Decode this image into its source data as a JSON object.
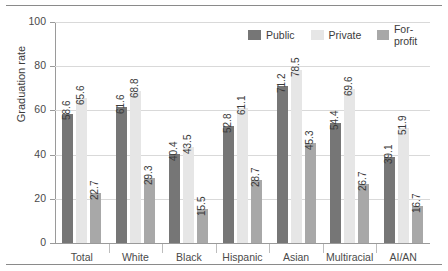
{
  "chart_data": {
    "type": "bar",
    "title": "",
    "subtitle": "",
    "xlabel": "",
    "ylabel": "Graduation rate",
    "ylim": [
      0,
      100
    ],
    "ytick_labels": [
      "0",
      "20",
      "40",
      "60",
      "80",
      "100"
    ],
    "ytick_values": [
      0,
      20,
      40,
      60,
      80,
      100
    ],
    "grid": true,
    "legend_position": "top-right",
    "categories": [
      "Total",
      "White",
      "Black",
      "Hispanic",
      "Asian",
      "Multiracial",
      "AI/AN"
    ],
    "series": [
      {
        "name": "Public",
        "color": "#767676",
        "values": [
          58.6,
          61.6,
          40.4,
          52.8,
          71.2,
          54.4,
          39.1
        ],
        "labels": [
          "58.6",
          "61.6",
          "40.4",
          "52.8",
          "71.2",
          "54.4",
          "39.1"
        ]
      },
      {
        "name": "Private",
        "color": "#e6e6e6",
        "values": [
          65.6,
          68.8,
          43.5,
          61.1,
          78.5,
          69.6,
          51.9
        ],
        "labels": [
          "65.6",
          "68.8",
          "43.5",
          "61.1",
          "78.5",
          "69.6",
          "51.9"
        ]
      },
      {
        "name": "For-profit",
        "color": "#a8a8a8",
        "values": [
          22.7,
          29.3,
          15.5,
          28.7,
          45.3,
          26.7,
          16.7
        ],
        "labels": [
          "22.7",
          "29.3",
          "15.5",
          "28.7",
          "45.3",
          "26.7",
          "16.7"
        ]
      }
    ]
  },
  "legend": {
    "items": [
      {
        "label": "Public",
        "color": "#767676"
      },
      {
        "label": "Private",
        "color": "#e6e6e6"
      },
      {
        "label": "For-profit",
        "color": "#a8a8a8"
      }
    ]
  }
}
